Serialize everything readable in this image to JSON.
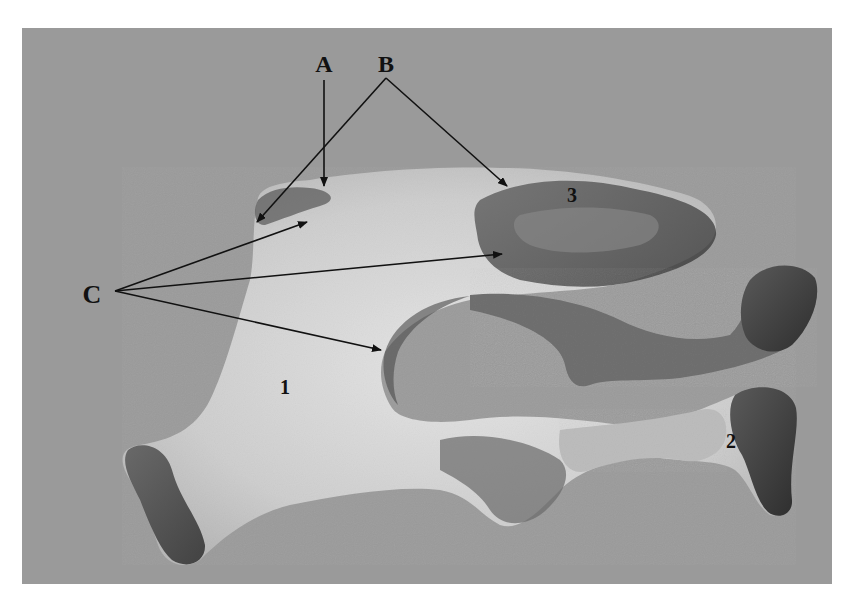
{
  "figure": {
    "type": "anatomical-specimen-photo",
    "background_color": "#9a9a9a",
    "panel": {
      "x": 22,
      "y": 28,
      "width": 810,
      "height": 556
    },
    "letter_labels": [
      {
        "id": "A",
        "text": "A",
        "x": 324,
        "y": 70
      },
      {
        "id": "B",
        "text": "B",
        "x": 386,
        "y": 70
      },
      {
        "id": "C",
        "text": "C",
        "x": 92,
        "y": 303
      }
    ],
    "number_labels": [
      {
        "id": "1",
        "text": "1",
        "x": 285,
        "y": 393
      },
      {
        "id": "2",
        "text": "2",
        "x": 731,
        "y": 447
      },
      {
        "id": "3",
        "text": "3",
        "x": 572,
        "y": 201
      }
    ],
    "arrows": [
      {
        "from_label": "A",
        "x1": 324,
        "y1": 80,
        "x2": 324,
        "y2": 186
      },
      {
        "from_label": "B",
        "x1": 386,
        "y1": 78,
        "x2": 257,
        "y2": 222
      },
      {
        "from_label": "B",
        "x1": 386,
        "y1": 78,
        "x2": 507,
        "y2": 186
      },
      {
        "from_label": "C",
        "x1": 115,
        "y1": 291,
        "x2": 307,
        "y2": 222
      },
      {
        "from_label": "C",
        "x1": 115,
        "y1": 291,
        "x2": 502,
        "y2": 254
      },
      {
        "from_label": "C",
        "x1": 115,
        "y1": 291,
        "x2": 381,
        "y2": 350
      }
    ]
  }
}
